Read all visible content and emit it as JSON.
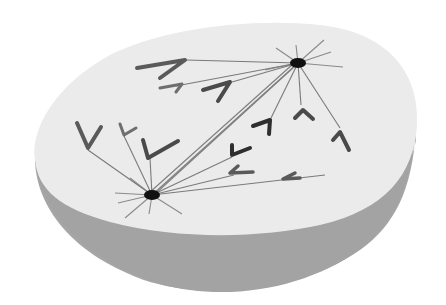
{
  "diagram": {
    "kind": "cell-spindle-illustration",
    "colors": {
      "background": "#ffffff",
      "cell_top": "#ebebeb",
      "cell_side": "#a6a6a6",
      "fiber": "#7a7a7a",
      "pole": "#111111",
      "chromosome_dark": "#3a3a3a",
      "chromosome_mid": "#5a5a5a",
      "chromosome_light": "#6e6e6e"
    },
    "poles": [
      {
        "id": "upper-pole",
        "cx": 298,
        "cy": 63,
        "rx": 8,
        "ry": 5
      },
      {
        "id": "lower-pole",
        "cx": 152,
        "cy": 195,
        "rx": 8,
        "ry": 5
      }
    ],
    "chromosome_count": 13
  }
}
